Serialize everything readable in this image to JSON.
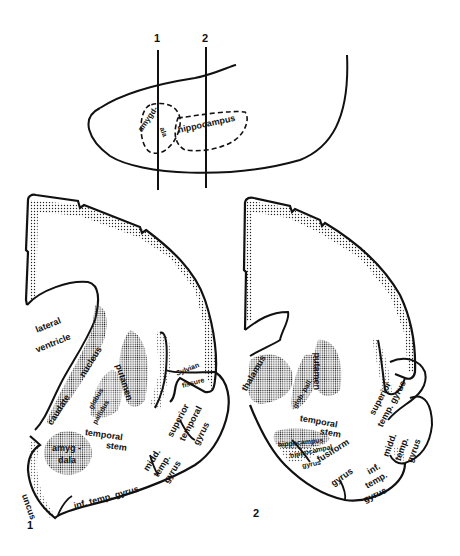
{
  "figure": {
    "overview": {
      "section_markers": [
        "1",
        "2"
      ],
      "labels": {
        "amygdala_part1": "amygd-",
        "amygdala_part2": "ala",
        "hippocampus": "hippocampus"
      }
    },
    "section1": {
      "number": "1",
      "labels": {
        "lateral": "lateral",
        "ventricle": "ventricle",
        "caudate": "caudate",
        "nucleus": "nucleus",
        "globus": "globus",
        "pallidus": "pallidus",
        "putamen": "putamen",
        "sylvian": "Sylvian",
        "fissure": "fissure",
        "superior": "superior",
        "temporal": "temporal",
        "gyrus": "gyrus",
        "temporal_stem_1": "temporal",
        "temporal_stem_2": "stem",
        "amyg": "amyg -",
        "dala": "dala",
        "midd": "midd.",
        "temp": "temp.",
        "midd_gyrus": "gyrus",
        "uncus": "uncus",
        "inf_temp_gyrus": "inf. temp. gyrus"
      }
    },
    "section2": {
      "number": "2",
      "labels": {
        "thalamus": "thalamus",
        "glob_pall": "glob. pall.",
        "putamen": "putamen",
        "temporal_stem_1": "temporal",
        "temporal_stem_2": "stem",
        "hippocampus": "hippocampus",
        "hippocampal": "hippocampal",
        "hippocampal_gyrus": "gyrus",
        "fusiform": "fusiform",
        "fusiform_gyrus": "gyrus",
        "superior": "superior",
        "temp_gyrus": "temp. gyrus",
        "midd": "midd.",
        "temp": "temp.",
        "midd_gyrus": "gyrus",
        "inf": "inf.",
        "inf_temp": "temp.",
        "inf_gyrus": "gyrus"
      }
    },
    "colors": {
      "ink": "#111111",
      "background": "#ffffff",
      "stipple": "#222222"
    }
  }
}
